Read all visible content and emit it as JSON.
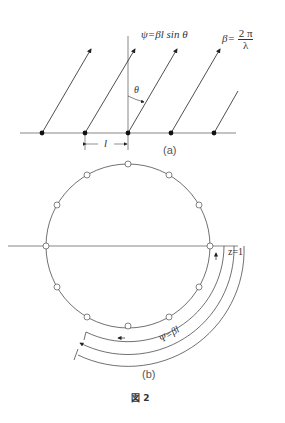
{
  "figure": {
    "caption": "図 2",
    "part_a": {
      "label": "(a)",
      "phase_eq": "ψ=βl sin θ",
      "beta_lhs": "β=",
      "beta_num": "2 π",
      "beta_den": "λ",
      "angle_label": "θ",
      "spacing_label": "l",
      "element_count": 5
    },
    "part_b": {
      "label": "(b)",
      "z_label": "z=1",
      "arc_label": "Ψ=βl",
      "circle_point_count": 12
    }
  }
}
